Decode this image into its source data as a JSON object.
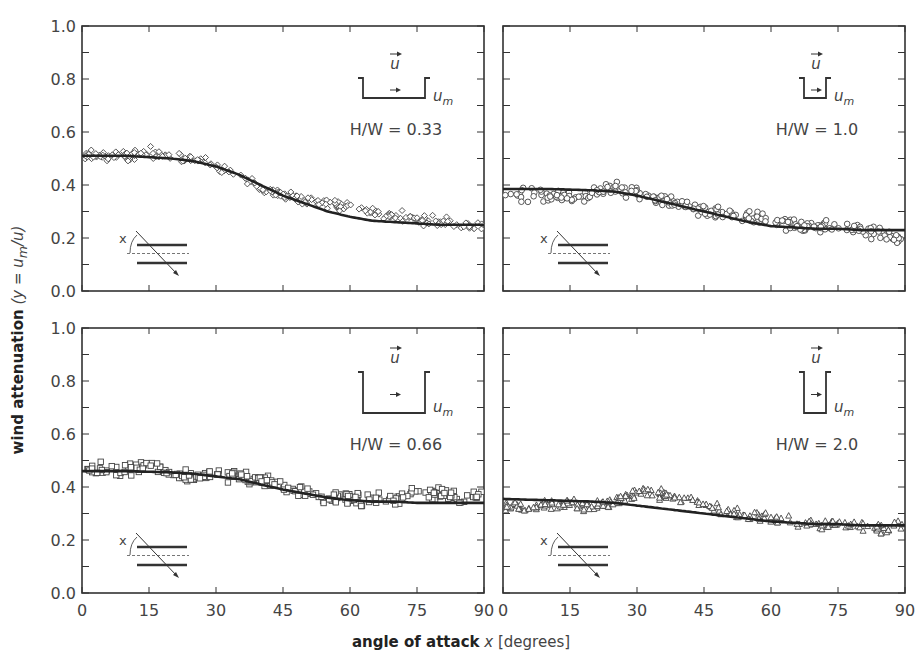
{
  "figure": {
    "ylabel_bold": "wind attenuation",
    "ylabel_math": "(y = u",
    "ylabel_sub": "m",
    "ylabel_end": "/u)",
    "xlabel_bold": "angle of attack",
    "xlabel_var": "x",
    "xlabel_unit": "[degrees]"
  },
  "colors": {
    "axis": "#333333",
    "curve": "#222222",
    "marker": "#444444",
    "text": "#444444"
  },
  "chart_data": [
    {
      "type": "scatter",
      "panel": "top-left",
      "title": "H/W = 0.33",
      "canyon_label": "u_m",
      "wind_label": "u",
      "marker": "diamond",
      "xlabel": "angle of attack x [degrees]",
      "ylabel": "wind attenuation (y = u_m/u)",
      "xlim": [
        0,
        90
      ],
      "ylim": [
        0,
        1.0
      ],
      "xticks": [
        0,
        15,
        30,
        45,
        60,
        75,
        90
      ],
      "yticks": [
        0.0,
        0.2,
        0.4,
        0.6,
        0.8,
        1.0
      ],
      "fit_curve": {
        "x": [
          0,
          10,
          20,
          25,
          30,
          35,
          40,
          45,
          50,
          55,
          60,
          65,
          70,
          75,
          80,
          85,
          90
        ],
        "y": [
          0.51,
          0.51,
          0.5,
          0.49,
          0.47,
          0.44,
          0.4,
          0.36,
          0.33,
          0.3,
          0.28,
          0.265,
          0.26,
          0.255,
          0.25,
          0.25,
          0.25
        ]
      },
      "scatter_trend": {
        "x": [
          0,
          5,
          10,
          15,
          20,
          25,
          30,
          35,
          40,
          45,
          50,
          55,
          60,
          65,
          70,
          75,
          80,
          85,
          90
        ],
        "y": [
          0.51,
          0.51,
          0.51,
          0.52,
          0.51,
          0.5,
          0.47,
          0.44,
          0.39,
          0.36,
          0.34,
          0.33,
          0.32,
          0.3,
          0.28,
          0.27,
          0.26,
          0.25,
          0.25
        ],
        "spread": 0.03
      }
    },
    {
      "type": "scatter",
      "panel": "top-right",
      "title": "H/W = 1.0",
      "canyon_label": "u_m",
      "wind_label": "u",
      "marker": "circle",
      "xlim": [
        0,
        90
      ],
      "ylim": [
        0,
        1.0
      ],
      "xticks": [
        0,
        15,
        30,
        45,
        60,
        75,
        90
      ],
      "yticks": [
        0.0,
        0.2,
        0.4,
        0.6,
        0.8,
        1.0
      ],
      "fit_curve": {
        "x": [
          0,
          10,
          20,
          25,
          30,
          35,
          40,
          45,
          50,
          55,
          60,
          65,
          70,
          75,
          80,
          85,
          90
        ],
        "y": [
          0.385,
          0.385,
          0.38,
          0.375,
          0.36,
          0.34,
          0.32,
          0.3,
          0.28,
          0.26,
          0.245,
          0.24,
          0.235,
          0.235,
          0.23,
          0.23,
          0.23
        ]
      },
      "scatter_trend": {
        "x": [
          0,
          5,
          10,
          15,
          20,
          25,
          30,
          35,
          40,
          45,
          50,
          55,
          60,
          65,
          70,
          75,
          80,
          85,
          90
        ],
        "y": [
          0.37,
          0.36,
          0.36,
          0.35,
          0.37,
          0.39,
          0.37,
          0.35,
          0.33,
          0.3,
          0.29,
          0.28,
          0.27,
          0.25,
          0.24,
          0.24,
          0.23,
          0.21,
          0.19
        ],
        "spread": 0.035
      }
    },
    {
      "type": "scatter",
      "panel": "bottom-left",
      "title": "H/W = 0.66",
      "canyon_label": "u_m",
      "wind_label": "u",
      "marker": "square",
      "xlim": [
        0,
        90
      ],
      "ylim": [
        0,
        1.0
      ],
      "xticks": [
        0,
        15,
        30,
        45,
        60,
        75,
        90
      ],
      "yticks": [
        0.0,
        0.2,
        0.4,
        0.6,
        0.8,
        1.0
      ],
      "fit_curve": {
        "x": [
          0,
          10,
          20,
          25,
          30,
          35,
          40,
          45,
          50,
          55,
          60,
          65,
          70,
          75,
          80,
          85,
          90
        ],
        "y": [
          0.46,
          0.46,
          0.455,
          0.45,
          0.44,
          0.43,
          0.41,
          0.39,
          0.375,
          0.36,
          0.35,
          0.345,
          0.345,
          0.34,
          0.34,
          0.34,
          0.34
        ]
      },
      "scatter_trend": {
        "x": [
          0,
          5,
          10,
          15,
          20,
          25,
          30,
          35,
          40,
          45,
          50,
          55,
          60,
          65,
          70,
          75,
          80,
          85,
          90
        ],
        "y": [
          0.46,
          0.47,
          0.46,
          0.48,
          0.45,
          0.44,
          0.45,
          0.44,
          0.43,
          0.4,
          0.38,
          0.36,
          0.36,
          0.35,
          0.36,
          0.38,
          0.37,
          0.36,
          0.37
        ],
        "spread": 0.035
      }
    },
    {
      "type": "scatter",
      "panel": "bottom-right",
      "title": "H/W = 2.0",
      "canyon_label": "u_m",
      "wind_label": "u",
      "marker": "triangle",
      "xlim": [
        0,
        90
      ],
      "ylim": [
        0,
        1.0
      ],
      "xticks": [
        0,
        15,
        30,
        45,
        60,
        75,
        90
      ],
      "yticks": [
        0.0,
        0.2,
        0.4,
        0.6,
        0.8,
        1.0
      ],
      "fit_curve": {
        "x": [
          0,
          10,
          20,
          25,
          30,
          35,
          40,
          45,
          50,
          55,
          60,
          65,
          70,
          75,
          80,
          85,
          90
        ],
        "y": [
          0.355,
          0.35,
          0.345,
          0.34,
          0.33,
          0.32,
          0.31,
          0.3,
          0.29,
          0.28,
          0.27,
          0.265,
          0.26,
          0.26,
          0.255,
          0.255,
          0.255
        ]
      },
      "scatter_trend": {
        "x": [
          0,
          5,
          10,
          15,
          20,
          25,
          30,
          35,
          40,
          45,
          50,
          55,
          60,
          65,
          70,
          75,
          80,
          85,
          90
        ],
        "y": [
          0.33,
          0.32,
          0.33,
          0.34,
          0.32,
          0.34,
          0.38,
          0.37,
          0.36,
          0.34,
          0.31,
          0.29,
          0.28,
          0.27,
          0.26,
          0.26,
          0.25,
          0.24,
          0.27
        ],
        "spread": 0.03
      }
    }
  ]
}
